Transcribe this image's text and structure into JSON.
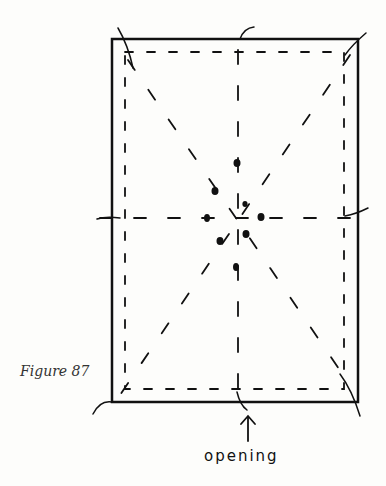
{
  "figure": {
    "caption": "Figure 87",
    "opening_label": "opening"
  },
  "colors": {
    "ink": "#111111",
    "background": "#fdfdfb"
  }
}
